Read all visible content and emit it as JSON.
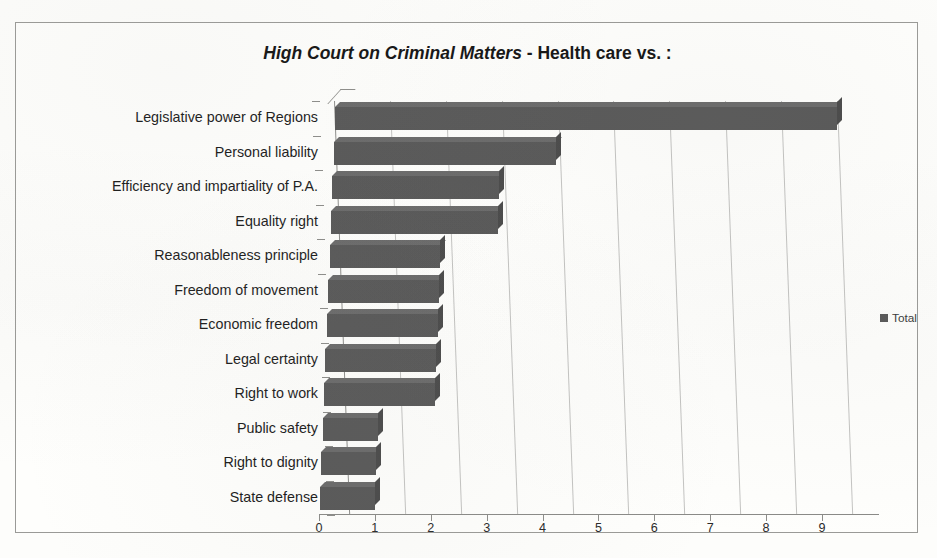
{
  "chart_data": {
    "type": "bar",
    "orientation": "horizontal",
    "title_main": "High Court on Criminal Matters",
    "title_rest": " - Health care vs. :",
    "title": "High Court on Criminal Matters - Health care vs. :",
    "categories": [
      "Legislative power of Regions",
      "Personal liability",
      "Efficiency and impartiality of P.A.",
      "Equality right",
      "Reasonableness principle",
      "Freedom of movement",
      "Economic freedom",
      "Legal certainty",
      "Right to work",
      "Public safety",
      "Right to dignity",
      "State defense"
    ],
    "values": [
      9,
      4,
      3,
      3,
      2,
      2,
      2,
      2,
      2,
      1,
      1,
      1
    ],
    "series": [
      {
        "name": "Total",
        "values": [
          9,
          4,
          3,
          3,
          2,
          2,
          2,
          2,
          2,
          1,
          1,
          1
        ],
        "color": "#585858"
      }
    ],
    "xlabel": "",
    "ylabel": "",
    "xlim": [
      0,
      9
    ],
    "xticks": [
      0,
      1,
      2,
      3,
      4,
      5,
      6,
      7,
      8,
      9
    ],
    "xtick_labels": [
      "0",
      "1",
      "2",
      "3",
      "4",
      "5",
      "6",
      "7",
      "8",
      "9"
    ],
    "grid": "vertical",
    "legend": {
      "position": "right",
      "entries": [
        "Total"
      ]
    },
    "style": "3d-bar",
    "bar_color": "#585858",
    "gridline_color": "#c3c3c1",
    "axis_color": "#8d8d8a",
    "background": "#fefefc"
  }
}
